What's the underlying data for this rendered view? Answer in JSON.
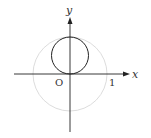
{
  "diagram": {
    "labels": {
      "x_axis": "x",
      "y_axis": "y",
      "origin": "O",
      "one": "1"
    },
    "colors": {
      "axis": "#222222",
      "circle": "#222222",
      "unit_circle": "#d8d8d8"
    }
  }
}
